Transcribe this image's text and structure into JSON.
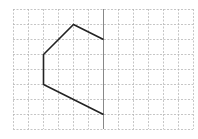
{
  "diagram": {
    "type": "grid-half-figure",
    "grid": {
      "columns": 12,
      "rows": 8,
      "origin_px": [
        13,
        9
      ],
      "cell_px": 15,
      "line_color": "#b8b8b8",
      "line_style": "dashed"
    },
    "symmetry_axis": {
      "column": 6,
      "color": "#888888",
      "style": "solid"
    },
    "polyline": {
      "color": "#222222",
      "points_grid": [
        [
          6,
          2
        ],
        [
          4,
          1
        ],
        [
          2,
          3
        ],
        [
          2,
          5
        ],
        [
          6,
          7
        ]
      ]
    }
  }
}
